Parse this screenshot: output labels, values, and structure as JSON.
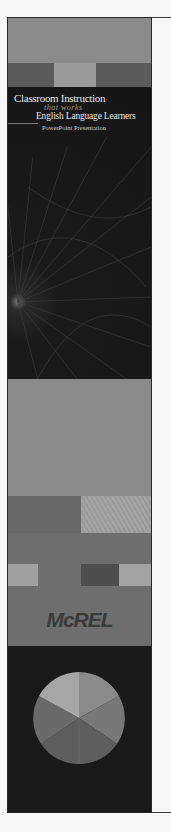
{
  "cover": {
    "title_line1": "Classroom Instruction",
    "title_line2": "that works",
    "title_line3": "English Language Learners",
    "subtitle": "PowerPoint Presentation",
    "publisher_logo": "McREL"
  },
  "decor": {
    "pie_slices": 5,
    "colors": {
      "top_band": "#8b8b8b",
      "title_block": "#1b1b1b",
      "title_text": "#e6e6e6",
      "pie_light": "#a8a8a8",
      "pie_dark": "#5a5a5a"
    }
  }
}
